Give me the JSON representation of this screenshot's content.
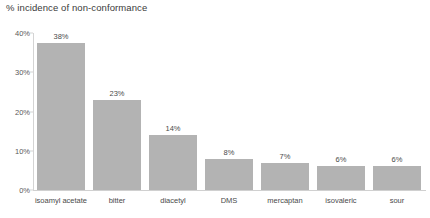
{
  "chart_data": {
    "type": "bar",
    "title": "% incidence of non-conformance",
    "xlabel": "",
    "ylabel": "",
    "categories": [
      "isoamyl acetate",
      "bitter",
      "diacetyl",
      "DMS",
      "mercaptan",
      "isovaleric",
      "sour"
    ],
    "values": [
      38,
      23,
      14,
      8,
      7,
      6,
      6
    ],
    "data_labels": [
      "38%",
      "23%",
      "14%",
      "8%",
      "7%",
      "6%",
      "6%"
    ],
    "ylim": [
      0,
      40
    ],
    "ytick_values": [
      0,
      10,
      20,
      30,
      40
    ],
    "ytick_labels": [
      "0%",
      "10%",
      "20%",
      "30%",
      "40%"
    ],
    "grid": false,
    "legend": null,
    "bar_color": "#b3b3b3",
    "axis_color": "#d4d4d4",
    "background_color": "#ffffff",
    "text_color": "#4a4a4a"
  }
}
